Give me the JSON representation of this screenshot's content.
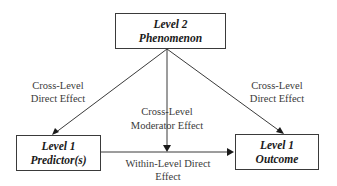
{
  "diagram": {
    "nodes": [
      {
        "id": "level2",
        "line1": "Level 2",
        "line2": "Phenomenon"
      },
      {
        "id": "predictor",
        "line1": "Level 1",
        "line2": "Predictor(s)"
      },
      {
        "id": "outcome",
        "line1": "Level 1",
        "line2": "Outcome"
      }
    ],
    "edges": [
      {
        "from": "level2",
        "to": "predictor",
        "line1": "Cross-Level",
        "line2": "Direct Effect"
      },
      {
        "from": "level2",
        "to": "outcome",
        "line1": "Cross-Level",
        "line2": "Direct Effect"
      },
      {
        "from": "level2",
        "to": "within-edge",
        "line1": "Cross-Level",
        "line2": "Moderator Effect"
      },
      {
        "from": "predictor",
        "to": "outcome",
        "line1": "Within-Level Direct",
        "line2": "Effect"
      }
    ]
  }
}
